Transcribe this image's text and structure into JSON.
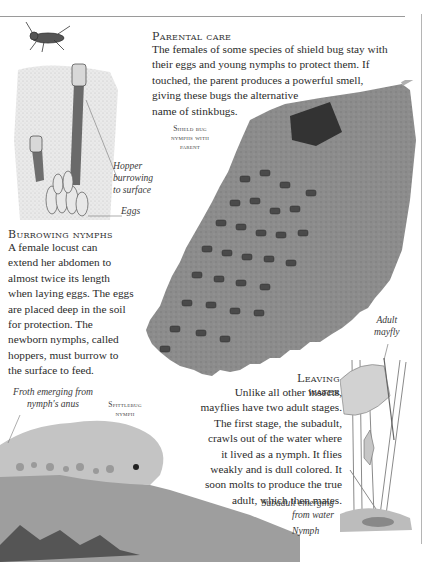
{
  "parental_care": {
    "heading": "Parental care",
    "body_lines": [
      "The females of some species of shield bug stay with",
      "their eggs and young nymphs to protect them. If",
      "touched, the parent produces a powerful smell,",
      "giving these bugs the alternative",
      "name of stinkbugs."
    ],
    "image_label_lines": [
      "Shield bug",
      "nymphs with",
      "parent"
    ]
  },
  "burrowing_nymphs": {
    "heading": "Burrowing nymphs",
    "body_lines": [
      "A female locust can",
      "extend her abdomen to",
      "almost twice its length",
      "when laying eggs. The eggs",
      "are placed deep in the soil",
      "for protection. The",
      "newborn nymphs, called",
      "hoppers, must burrow to",
      "the surface to feed."
    ],
    "captions": {
      "hopper_lines": [
        "Hopper",
        "burrowing",
        "to surface"
      ],
      "eggs": "Eggs"
    }
  },
  "leaving_water": {
    "heading": "Leaving water",
    "body_lines": [
      "Unlike all other insects,",
      "mayflies have two adult stages.",
      "The first stage, the subadult,",
      "crawls out of the water where",
      "it lived as a nymph. It flies",
      "weakly and is dull colored. It",
      "soon molts to produce the true",
      "adult, which then mates."
    ],
    "captions": {
      "adult_lines": [
        "Adult",
        "mayfly"
      ],
      "subadult_lines": [
        "Subadult emerging",
        "from water"
      ],
      "nymph": "Nymph"
    }
  },
  "spittlebug": {
    "image_label_lines": [
      "Spittlebug",
      "nymph"
    ],
    "caption_lines": [
      "Froth emerging from",
      "nymph's anus"
    ]
  },
  "colors": {
    "text": "#2b2b2b",
    "rule": "#9a9a9a",
    "leaf": "#8f8f8f",
    "froth": "#bdbdbd"
  }
}
